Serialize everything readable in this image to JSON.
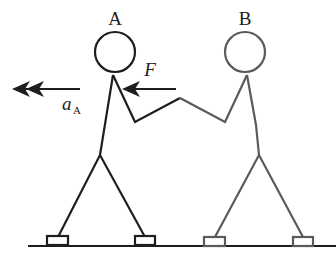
{
  "diagram": {
    "type": "physics-free-body-sketch",
    "persons": [
      {
        "id": "A",
        "label": "A",
        "color": "#1e1e1e"
      },
      {
        "id": "B",
        "label": "B",
        "color": "#5a5a5a"
      }
    ],
    "force": {
      "label": "F",
      "direction": "left"
    },
    "acceleration": {
      "symbol": "a",
      "subscript": "A",
      "direction": "left"
    },
    "colors": {
      "person_a": "#1e1e1e",
      "person_b": "#5a5a5a",
      "ground": "#1e1e1e",
      "background": "#ffffff"
    }
  }
}
